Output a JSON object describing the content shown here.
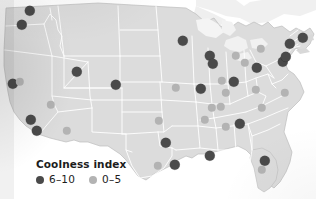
{
  "legend": {
    "title": "Coolness index",
    "items": [
      {
        "label": "6–10",
        "color": "#4a4a4a",
        "class": "high"
      },
      {
        "label": "0–5",
        "color": "#b3b3b3",
        "class": "low"
      }
    ]
  },
  "chart_data": {
    "type": "scatter",
    "title": "Coolness index",
    "subtitle": "",
    "xlabel": "",
    "ylabel": "",
    "projection": "united-states-map",
    "grid": false,
    "legend_position": "bottom-left",
    "map": {
      "land_fill": "#dcdcdc",
      "border_color": "#ffffff",
      "outline_color": "#b8b8b8",
      "water_fill": "#f2f2f2",
      "background": "#ffffff"
    },
    "scale": {
      "name": "Coolness index",
      "bins": [
        {
          "label": "6–10",
          "range": [
            6,
            10
          ],
          "color": "#4a4a4a",
          "radius": 5
        },
        {
          "label": "0–5",
          "range": [
            0,
            5
          ],
          "color": "#b3b3b3",
          "radius": 4
        }
      ]
    },
    "points": [
      {
        "bin": "6-10",
        "x": 30,
        "y": 11
      },
      {
        "bin": "6-10",
        "x": 22,
        "y": 25
      },
      {
        "bin": "6-10",
        "x": 13,
        "y": 84
      },
      {
        "bin": "0-5",
        "x": 20,
        "y": 82
      },
      {
        "bin": "6-10",
        "x": 31,
        "y": 120
      },
      {
        "bin": "6-10",
        "x": 37,
        "y": 131
      },
      {
        "bin": "0-5",
        "x": 51,
        "y": 105
      },
      {
        "bin": "0-5",
        "x": 67,
        "y": 131
      },
      {
        "bin": "6-10",
        "x": 77,
        "y": 72
      },
      {
        "bin": "6-10",
        "x": 116,
        "y": 85
      },
      {
        "bin": "0-5",
        "x": 159,
        "y": 121
      },
      {
        "bin": "6-10",
        "x": 166,
        "y": 143
      },
      {
        "bin": "6-10",
        "x": 175,
        "y": 165
      },
      {
        "bin": "0-5",
        "x": 158,
        "y": 166
      },
      {
        "bin": "6-10",
        "x": 183,
        "y": 41
      },
      {
        "bin": "0-5",
        "x": 176,
        "y": 88
      },
      {
        "bin": "6-10",
        "x": 210,
        "y": 56
      },
      {
        "bin": "6-10",
        "x": 213,
        "y": 64
      },
      {
        "bin": "6-10",
        "x": 201,
        "y": 89
      },
      {
        "bin": "0-5",
        "x": 222,
        "y": 81
      },
      {
        "bin": "0-5",
        "x": 226,
        "y": 93
      },
      {
        "bin": "6-10",
        "x": 234,
        "y": 82
      },
      {
        "bin": "0-5",
        "x": 236,
        "y": 56
      },
      {
        "bin": "0-5",
        "x": 245,
        "y": 63
      },
      {
        "bin": "6-10",
        "x": 257,
        "y": 68
      },
      {
        "bin": "0-5",
        "x": 261,
        "y": 49
      },
      {
        "bin": "6-10",
        "x": 283,
        "y": 62
      },
      {
        "bin": "6-10",
        "x": 286,
        "y": 57
      },
      {
        "bin": "6-10",
        "x": 303,
        "y": 38
      },
      {
        "bin": "6-10",
        "x": 290,
        "y": 44
      },
      {
        "bin": "0-5",
        "x": 212,
        "y": 108
      },
      {
        "bin": "0-5",
        "x": 221,
        "y": 107
      },
      {
        "bin": "0-5",
        "x": 205,
        "y": 120
      },
      {
        "bin": "0-5",
        "x": 256,
        "y": 90
      },
      {
        "bin": "0-5",
        "x": 262,
        "y": 108
      },
      {
        "bin": "0-5",
        "x": 285,
        "y": 93
      },
      {
        "bin": "6-10",
        "x": 240,
        "y": 124
      },
      {
        "bin": "0-5",
        "x": 226,
        "y": 127
      },
      {
        "bin": "6-10",
        "x": 210,
        "y": 156
      },
      {
        "bin": "6-10",
        "x": 265,
        "y": 161
      },
      {
        "bin": "0-5",
        "x": 262,
        "y": 170
      }
    ]
  }
}
